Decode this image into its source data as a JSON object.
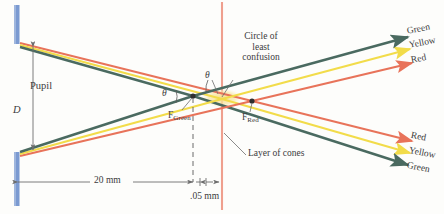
{
  "figure": {
    "colors": {
      "green_ray": "#4a6a60",
      "yellow_ray": "#f2dc4a",
      "red_ray": "#e8735a",
      "pupil": "#7b9ad1",
      "cone_layer": "#ef9f8e",
      "dimension_line": "#6d6d6d",
      "text": "#3b3b3b",
      "blur_patch": "#f7e6a8"
    }
  },
  "labels": {
    "pupil": "Pupil",
    "pupil_diameter_symbol": "D",
    "circle_of_least_confusion": [
      "Circle of",
      "least",
      "confusion"
    ],
    "layer_of_cones": "Layer of cones",
    "focus_green_letter": "F",
    "focus_green_sub": "Green",
    "focus_red_letter": "F",
    "focus_red_sub": "Red",
    "theta_upper": "θ",
    "theta_lower": "θ"
  },
  "dimensions": {
    "axial_distance": "20 mm",
    "focal_separation": ".05 mm"
  },
  "ray_labels_top": [
    {
      "name": "green",
      "text": "Green"
    },
    {
      "name": "yellow",
      "text": "Yellow"
    },
    {
      "name": "red",
      "text": "Red"
    }
  ],
  "ray_labels_bottom": [
    {
      "name": "red",
      "text": "Red"
    },
    {
      "name": "yellow",
      "text": "Yellow"
    },
    {
      "name": "green",
      "text": "Green"
    }
  ]
}
